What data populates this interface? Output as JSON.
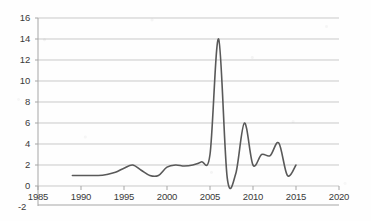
{
  "chart_data": {
    "type": "line",
    "title": "",
    "subtitle": "",
    "xlabel": "",
    "ylabel": "",
    "xlim": [
      1985,
      2020
    ],
    "ylim": [
      -2,
      16
    ],
    "grid": true,
    "legend": "none",
    "axis": {
      "y_ticks": [
        16,
        14,
        12,
        10,
        8,
        6,
        4,
        2,
        0,
        -2
      ],
      "y_tick_labels": [
        "16",
        "14",
        "12",
        "10",
        "8",
        "6",
        "4",
        "2",
        "0",
        "-2"
      ],
      "x_ticks": [
        1985,
        1990,
        1995,
        2000,
        2005,
        2010,
        2015,
        2020
      ],
      "x_tick_labels": [
        "1985",
        "1990",
        "1995",
        "2000",
        "2005",
        "2010",
        "2015",
        "2020"
      ]
    },
    "series": [
      {
        "name": "series-1",
        "color": "#595959",
        "x": [
          1989,
          1990,
          1991,
          1992,
          1993,
          1994,
          1995,
          1996,
          1997,
          1998,
          1999,
          2000,
          2001,
          2002,
          2003,
          2004,
          2005,
          2006,
          2007,
          2008,
          2009,
          2010,
          2011,
          2012,
          2013,
          2014,
          2015
        ],
        "values": [
          1.0,
          1.0,
          1.0,
          1.0,
          1.1,
          1.3,
          1.7,
          2.0,
          1.5,
          1.0,
          1.0,
          1.8,
          2.0,
          1.9,
          2.0,
          2.3,
          3.0,
          14.0,
          0.8,
          1.2,
          6.0,
          2.0,
          3.0,
          2.9,
          4.1,
          1.0,
          2.0
        ]
      }
    ]
  },
  "colors": {
    "line": "#595959",
    "grid": "#c9c9c9",
    "axis": "#a6a6a6",
    "tick_text": "#3a3a3a",
    "background": "#fefefe"
  }
}
